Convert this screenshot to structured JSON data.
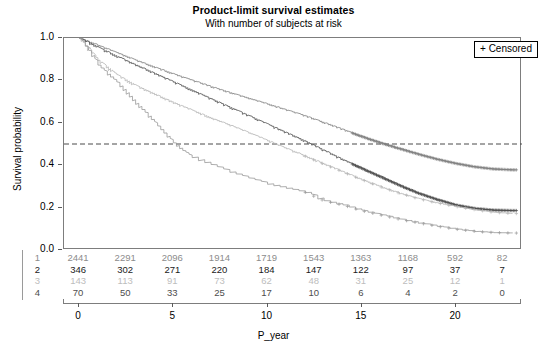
{
  "title": {
    "main": "Product-limit survival estimates",
    "sub": "With number of subjects at risk"
  },
  "legend": {
    "censored_label": "+ Censored"
  },
  "chart_data": {
    "type": "line",
    "title": "Product-limit survival estimates",
    "subtitle": "With number of subjects at risk",
    "xlabel": "P_year",
    "ylabel": "Survival probability",
    "xlim": [
      -0.8,
      23.5
    ],
    "ylim": [
      0.0,
      1.0
    ],
    "xticks": [
      0,
      5,
      10,
      15,
      20
    ],
    "yticks": [
      0.0,
      0.2,
      0.4,
      0.6,
      0.8,
      1.0
    ],
    "ytick_labels": [
      "0.0",
      "0.2",
      "0.4",
      "0.6",
      "0.8",
      "1.0"
    ],
    "xtick_labels": [
      "0",
      "5",
      "10",
      "15",
      "20"
    ],
    "grid": false,
    "legend_position": "top-right",
    "reference_line": {
      "y": 0.5,
      "style": "dashed",
      "color": "#4a4a4a"
    },
    "censor_marker": "+",
    "series": [
      {
        "name": "1",
        "color": "#808080",
        "points": [
          [
            0,
            1.0
          ],
          [
            1,
            0.965
          ],
          [
            2,
            0.93
          ],
          [
            3,
            0.895
          ],
          [
            4,
            0.862
          ],
          [
            5,
            0.83
          ],
          [
            6,
            0.8
          ],
          [
            7,
            0.77
          ],
          [
            8,
            0.742
          ],
          [
            9,
            0.715
          ],
          [
            10,
            0.688
          ],
          [
            11,
            0.66
          ],
          [
            12,
            0.632
          ],
          [
            13,
            0.6
          ],
          [
            14,
            0.568
          ],
          [
            15,
            0.535
          ],
          [
            16,
            0.505
          ],
          [
            17,
            0.478
          ],
          [
            18,
            0.452
          ],
          [
            19,
            0.428
          ],
          [
            20,
            0.408
          ],
          [
            21,
            0.392
          ],
          [
            22,
            0.382
          ],
          [
            23,
            0.378
          ]
        ],
        "final_value": 0.38
      },
      {
        "name": "2",
        "color": "#4d4d4d",
        "points": [
          [
            0,
            1.0
          ],
          [
            1,
            0.955
          ],
          [
            2,
            0.912
          ],
          [
            3,
            0.872
          ],
          [
            4,
            0.832
          ],
          [
            5,
            0.792
          ],
          [
            6,
            0.752
          ],
          [
            7,
            0.712
          ],
          [
            8,
            0.672
          ],
          [
            9,
            0.632
          ],
          [
            10,
            0.592
          ],
          [
            11,
            0.552
          ],
          [
            12,
            0.512
          ],
          [
            13,
            0.468
          ],
          [
            14,
            0.425
          ],
          [
            15,
            0.385
          ],
          [
            16,
            0.345
          ],
          [
            17,
            0.305
          ],
          [
            18,
            0.268
          ],
          [
            19,
            0.238
          ],
          [
            20,
            0.212
          ],
          [
            21,
            0.196
          ],
          [
            22,
            0.188
          ],
          [
            23,
            0.186
          ]
        ],
        "final_value": 0.19
      },
      {
        "name": "3",
        "color": "#b5b5b5",
        "points": [
          [
            0,
            1.0
          ],
          [
            1,
            0.895
          ],
          [
            2,
            0.825
          ],
          [
            3,
            0.775
          ],
          [
            4,
            0.735
          ],
          [
            5,
            0.695
          ],
          [
            6,
            0.658
          ],
          [
            7,
            0.622
          ],
          [
            8,
            0.588
          ],
          [
            9,
            0.552
          ],
          [
            10,
            0.515
          ],
          [
            11,
            0.478
          ],
          [
            12,
            0.442
          ],
          [
            13,
            0.405
          ],
          [
            14,
            0.368
          ],
          [
            15,
            0.332
          ],
          [
            16,
            0.298
          ],
          [
            17,
            0.268
          ],
          [
            18,
            0.242
          ],
          [
            19,
            0.222
          ],
          [
            20,
            0.205
          ],
          [
            21,
            0.19
          ],
          [
            22,
            0.178
          ],
          [
            23,
            0.172
          ]
        ],
        "final_value": 0.17
      },
      {
        "name": "4",
        "color": "#999999",
        "points": [
          [
            0,
            1.0
          ],
          [
            0.5,
            0.94
          ],
          [
            1,
            0.872
          ],
          [
            1.5,
            0.83
          ],
          [
            2,
            0.79
          ],
          [
            2.5,
            0.742
          ],
          [
            3,
            0.692
          ],
          [
            3.5,
            0.648
          ],
          [
            4,
            0.6
          ],
          [
            4.5,
            0.552
          ],
          [
            5,
            0.505
          ],
          [
            5.5,
            0.468
          ],
          [
            6,
            0.438
          ],
          [
            7,
            0.402
          ],
          [
            8,
            0.368
          ],
          [
            9,
            0.338
          ],
          [
            10,
            0.312
          ],
          [
            11,
            0.292
          ],
          [
            12,
            0.272
          ],
          [
            13,
            0.232
          ],
          [
            14,
            0.212
          ],
          [
            15,
            0.185
          ],
          [
            16,
            0.165
          ],
          [
            17,
            0.145
          ],
          [
            18,
            0.128
          ],
          [
            19,
            0.112
          ],
          [
            20,
            0.098
          ],
          [
            21,
            0.088
          ],
          [
            22,
            0.082
          ],
          [
            23,
            0.08
          ]
        ],
        "final_value": 0.08
      }
    ]
  },
  "risk_table": {
    "x_positions": [
      0,
      2.5,
      5,
      7.5,
      10,
      12.5,
      15,
      17.5,
      20,
      22.5
    ],
    "rows": [
      {
        "label": "1",
        "color": "#8c8c8c",
        "values": [
          "2441",
          "2291",
          "2096",
          "1914",
          "1719",
          "1543",
          "1363",
          "1168",
          "592",
          "82"
        ]
      },
      {
        "label": "2",
        "color": "#1a1a1a",
        "values": [
          "346",
          "302",
          "271",
          "220",
          "184",
          "147",
          "122",
          "97",
          "37",
          "7"
        ]
      },
      {
        "label": "3",
        "color": "#bdbdbd",
        "values": [
          "143",
          "113",
          "91",
          "73",
          "62",
          "48",
          "31",
          "25",
          "12",
          "1"
        ]
      },
      {
        "label": "4",
        "color": "#4d4d4d",
        "values": [
          "70",
          "50",
          "33",
          "25",
          "17",
          "10",
          "6",
          "4",
          "2",
          "0"
        ]
      }
    ]
  }
}
